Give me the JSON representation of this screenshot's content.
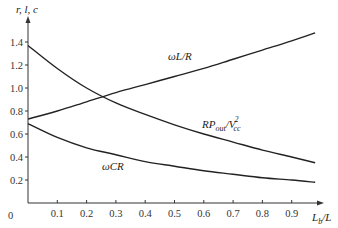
{
  "chart_data": {
    "type": "line",
    "title": "",
    "xlabel": "L_b/L",
    "ylabel": "r, l, c",
    "xlim": [
      0,
      1.0
    ],
    "ylim": [
      0,
      1.5
    ],
    "grid": false,
    "x_ticks": [
      "0.1",
      "0.2",
      "0.3",
      "0.4",
      "0.5",
      "0.6",
      "0.7",
      "0.8",
      "0.9"
    ],
    "y_ticks": [
      "0.2",
      "0.4",
      "0.6",
      "0.8",
      "1.0",
      "1.2",
      "1.4"
    ],
    "origin_label": "0",
    "x": [
      0,
      0.1,
      0.2,
      0.3,
      0.4,
      0.5,
      0.6,
      0.7,
      0.8,
      0.9,
      0.98
    ],
    "series": [
      {
        "name": "ωL/R",
        "label_main": "ωL/R",
        "values": [
          0.73,
          0.8,
          0.88,
          0.96,
          1.03,
          1.1,
          1.17,
          1.25,
          1.33,
          1.41,
          1.48
        ]
      },
      {
        "name": "RPout/Vcc²",
        "label_main": "RP",
        "label_sub1": "out",
        "label_mid": "/V",
        "label_sup": "2",
        "label_sub2": "cc",
        "values": [
          1.37,
          1.17,
          1.0,
          0.87,
          0.77,
          0.68,
          0.6,
          0.53,
          0.46,
          0.4,
          0.35
        ]
      },
      {
        "name": "ωCR",
        "label_main": "ωCR",
        "values": [
          0.69,
          0.57,
          0.48,
          0.42,
          0.36,
          0.32,
          0.28,
          0.25,
          0.22,
          0.2,
          0.18
        ]
      }
    ],
    "xlabel_main": "L",
    "xlabel_sub": "b",
    "xlabel_rest": "/L"
  }
}
